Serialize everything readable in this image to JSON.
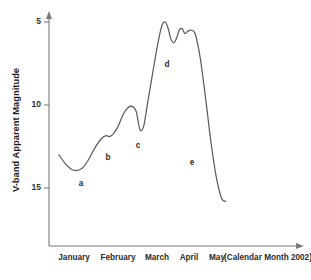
{
  "chart_data": {
    "type": "line",
    "title": "",
    "subtitle": "",
    "xlabel": "(Calendar Month 2002)",
    "ylabel": "V-band  Apparent Magnitude",
    "x_tick_labels": [
      "January",
      "February",
      "March",
      "April",
      "May"
    ],
    "x_axis_caption": "(Calendar Month 2002)",
    "y_tick_labels": [
      "5",
      "10",
      "15"
    ],
    "y_tick_values": [
      5,
      10,
      15
    ],
    "ylim": [
      16.6,
      4.2
    ],
    "y_axis_inverted": true,
    "grid": false,
    "legend": "none",
    "series": [
      {
        "name": "V-band light curve",
        "x": [
          0.28,
          0.45,
          0.62,
          0.78,
          0.95,
          1.12,
          1.3,
          1.48,
          1.62,
          1.72,
          1.82,
          1.95,
          2.1,
          2.25,
          2.38,
          2.48,
          2.56,
          2.62,
          2.7,
          2.8,
          2.92,
          3.04,
          3.14,
          3.22,
          3.3,
          3.38,
          3.46,
          3.54,
          3.62,
          3.7,
          3.78,
          3.86,
          3.95,
          4.05,
          4.16,
          4.3,
          4.45,
          4.6,
          4.75,
          4.9,
          5.02
        ],
        "y": [
          13.0,
          13.5,
          13.85,
          13.95,
          13.8,
          13.3,
          12.6,
          12.05,
          11.85,
          11.9,
          11.75,
          11.35,
          10.6,
          10.15,
          10.1,
          10.4,
          11.3,
          11.55,
          11.2,
          9.9,
          8.4,
          6.9,
          5.8,
          5.15,
          5.0,
          5.35,
          6.0,
          6.25,
          6.0,
          5.5,
          5.4,
          5.7,
          5.55,
          5.5,
          5.75,
          7.2,
          9.6,
          12.2,
          14.3,
          15.6,
          15.8
        ]
      }
    ],
    "annotations": [
      {
        "label": "a",
        "x_px": 81,
        "y_px": 184
      },
      {
        "label": "b",
        "x_px": 108,
        "y_px": 158
      },
      {
        "label": "c",
        "x_px": 138,
        "y_px": 146
      },
      {
        "label": "d",
        "x_px": 167,
        "y_px": 65
      },
      {
        "label": "e",
        "x_px": 192,
        "y_px": 163
      }
    ],
    "colors": {
      "curve": "#5d5d5d",
      "axis": "#7a7a7a",
      "text": "#2b2b2b",
      "background": "#ffffff"
    }
  }
}
